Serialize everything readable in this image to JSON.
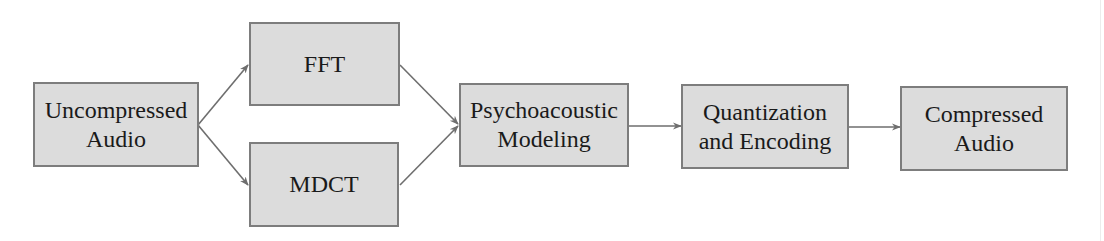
{
  "diagram": {
    "nodes": [
      {
        "id": "uncompressed",
        "lines": [
          "Uncompressed",
          "Audio"
        ]
      },
      {
        "id": "fft",
        "lines": [
          "FFT"
        ]
      },
      {
        "id": "mdct",
        "lines": [
          "MDCT"
        ]
      },
      {
        "id": "psycho",
        "lines": [
          "Psychoacoustic",
          "Modeling"
        ]
      },
      {
        "id": "quant",
        "lines": [
          "Quantization",
          "and Encoding"
        ]
      },
      {
        "id": "compressed",
        "lines": [
          "Compressed",
          "Audio"
        ]
      }
    ],
    "edges": [
      {
        "from": "uncompressed",
        "to": "fft"
      },
      {
        "from": "uncompressed",
        "to": "mdct"
      },
      {
        "from": "fft",
        "to": "psycho"
      },
      {
        "from": "mdct",
        "to": "psycho"
      },
      {
        "from": "psycho",
        "to": "quant"
      },
      {
        "from": "quant",
        "to": "compressed"
      }
    ],
    "colors": {
      "node_fill": "#dcdcdc",
      "node_border": "#7d7d7d",
      "edge": "#6e6e6e",
      "text": "#1a1a1a"
    }
  }
}
